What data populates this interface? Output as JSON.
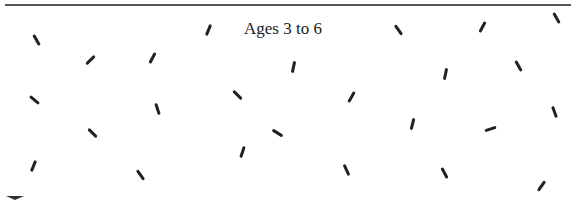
{
  "panel": {
    "title": "Ages 3 to 6",
    "stroke_color": "#222222",
    "rule_color": "#555555"
  },
  "strokes": [
    {
      "x": 36,
      "y": 40,
      "angle": -30
    },
    {
      "x": 90,
      "y": 60,
      "angle": 45
    },
    {
      "x": 152,
      "y": 58,
      "angle": 28
    },
    {
      "x": 208,
      "y": 30,
      "angle": 22
    },
    {
      "x": 293,
      "y": 67,
      "angle": 12
    },
    {
      "x": 398,
      "y": 30,
      "angle": -35
    },
    {
      "x": 482,
      "y": 27,
      "angle": 28
    },
    {
      "x": 556,
      "y": 18,
      "angle": -30
    },
    {
      "x": 445,
      "y": 74,
      "angle": 12
    },
    {
      "x": 518,
      "y": 66,
      "angle": -30
    },
    {
      "x": 34,
      "y": 100,
      "angle": -50
    },
    {
      "x": 157,
      "y": 109,
      "angle": -18
    },
    {
      "x": 237,
      "y": 95,
      "angle": -45
    },
    {
      "x": 351,
      "y": 97,
      "angle": 30
    },
    {
      "x": 92,
      "y": 133,
      "angle": -45
    },
    {
      "x": 277,
      "y": 133,
      "angle": -58
    },
    {
      "x": 412,
      "y": 124,
      "angle": 14
    },
    {
      "x": 490,
      "y": 129,
      "angle": 72
    },
    {
      "x": 554,
      "y": 112,
      "angle": -20
    },
    {
      "x": 33,
      "y": 166,
      "angle": 22
    },
    {
      "x": 140,
      "y": 175,
      "angle": -35
    },
    {
      "x": 242,
      "y": 152,
      "angle": 18
    },
    {
      "x": 346,
      "y": 170,
      "angle": -25
    },
    {
      "x": 444,
      "y": 173,
      "angle": -28
    },
    {
      "x": 541,
      "y": 186,
      "angle": 35
    }
  ]
}
